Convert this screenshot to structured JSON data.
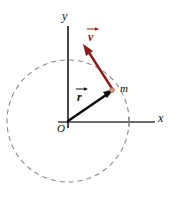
{
  "figure": {
    "background_color": "#ffffff",
    "width": 173,
    "height": 197
  },
  "axes": {
    "x_label": "x",
    "y_label": "y",
    "origin_label": "O",
    "x_axis_color": "#6b6b6b",
    "y_axis_color": "#1a1a1a"
  },
  "orbit": {
    "style": "dashed",
    "color": "#8a8a8a",
    "center": {
      "x": 68,
      "y": 121
    },
    "radius": 61
  },
  "particle": {
    "label": "m",
    "position": {
      "x": 113,
      "y": 90
    },
    "marker_color": "#c98a72"
  },
  "vectors": [
    {
      "name": "position-vector",
      "label": "r",
      "notation": "arrow-over",
      "color": "#0d0d0d",
      "from": {
        "x": 68,
        "y": 121
      },
      "to": {
        "x": 113,
        "y": 90
      },
      "label_position": {
        "x": 78,
        "y": 88
      }
    },
    {
      "name": "velocity-vector",
      "label": "v",
      "notation": "arrow-over",
      "color": "#8c1b17",
      "from": {
        "x": 113,
        "y": 90
      },
      "to": {
        "x": 84,
        "y": 45
      },
      "label_position": {
        "x": 89,
        "y": 28
      }
    }
  ]
}
